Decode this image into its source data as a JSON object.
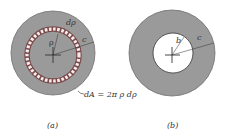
{
  "figure_a": {
    "caption": "(a)",
    "labels": {
      "d_rho": "dρ",
      "rho": "ρ",
      "c": "c",
      "area_element": "dA = 2π ρ dρ"
    }
  },
  "figure_b": {
    "caption": "(b)",
    "labels": {
      "b": "b",
      "c": "c"
    }
  },
  "colors": {
    "shaft_fill": "#9a9a9a",
    "ring_fill": "#f4ecec",
    "ring_outline": "#7a4a4a",
    "hole_fill": "#ffffff",
    "line": "#333333"
  }
}
